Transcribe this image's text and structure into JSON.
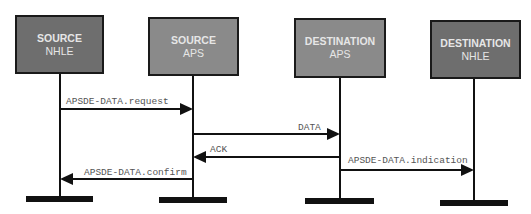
{
  "diagram": {
    "type": "sequence",
    "participants": [
      {
        "id": "source-nhle",
        "line1": "SOURCE",
        "line2": "NHLE",
        "fill": "#6e6e6e"
      },
      {
        "id": "source-aps",
        "line1": "SOURCE",
        "line2": "APS",
        "fill": "#8a8a8a"
      },
      {
        "id": "destination-aps",
        "line1": "DESTINATION",
        "line2": "APS",
        "fill": "#8a8a8a"
      },
      {
        "id": "destination-nhle",
        "line1": "DESTINATION",
        "line2": "NHLE",
        "fill": "#6e6e6e"
      }
    ],
    "messages": [
      {
        "label": "APSDE-DATA.request",
        "from": "source-nhle",
        "to": "source-aps"
      },
      {
        "label": "DATA",
        "from": "source-aps",
        "to": "destination-aps"
      },
      {
        "label": "ACK",
        "from": "destination-aps",
        "to": "source-aps"
      },
      {
        "label": "APSDE-DATA.indication",
        "from": "destination-aps",
        "to": "destination-nhle"
      },
      {
        "label": "APSDE-DATA.confirm",
        "from": "source-aps",
        "to": "source-nhle"
      }
    ]
  }
}
